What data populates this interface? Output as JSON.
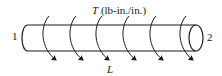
{
  "diagram": {
    "load_label": {
      "symbol": "T",
      "units": "(lb-in./in.)"
    },
    "end_labels": {
      "left": "1",
      "right": "2"
    },
    "length_label": "L",
    "arrows": {
      "count": 6,
      "x_positions": [
        45,
        72,
        98,
        125,
        152,
        182
      ],
      "icon": "curved-torque-arrow-icon"
    },
    "colors": {
      "stroke": "#1a1a1a",
      "background": "#ffffff"
    }
  }
}
